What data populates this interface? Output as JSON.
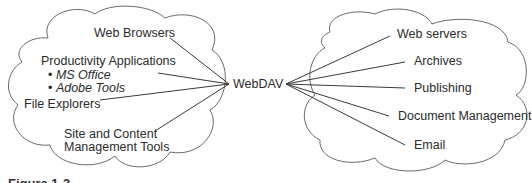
{
  "diagram": {
    "hub": {
      "label": "WebDAV"
    },
    "clients": {
      "web_browsers": "Web Browsers",
      "productivity": "Productivity Applications",
      "productivity_items": [
        "MS Office",
        "Adobe Tools"
      ],
      "bullet": "•",
      "file_explorers": "File Explorers",
      "site_mgmt_line1": "Site and Content",
      "site_mgmt_line2": "Management Tools"
    },
    "services": {
      "web_servers": "Web servers",
      "archives": "Archives",
      "publishing": "Publishing",
      "document_management": "Document Management",
      "email": "Email"
    },
    "caption": "Figure 1-3"
  },
  "colors": {
    "line": "#3a3a3a",
    "cloud": "#6a6a6a",
    "text": "#2b2b2b"
  }
}
